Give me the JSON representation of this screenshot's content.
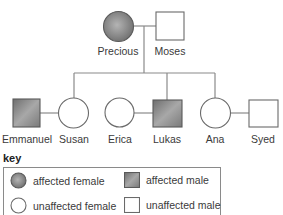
{
  "diagram": {
    "type": "pedigree",
    "colors": {
      "affected_fill_light": "#b4b4b4",
      "affected_fill_dark": "#6e6e6e",
      "outline": "#5a5a5a",
      "line": "#8a8a8a",
      "text": "#3a3a3a"
    },
    "generation_1": [
      {
        "name": "Precious",
        "sex": "female",
        "status": "affected"
      },
      {
        "name": "Moses",
        "sex": "male",
        "status": "unaffected"
      }
    ],
    "generation_2": [
      {
        "name": "Emmanuel",
        "sex": "male",
        "status": "affected",
        "relation": "partner of Susan"
      },
      {
        "name": "Susan",
        "sex": "female",
        "status": "unaffected",
        "relation": "child of Precious and Moses"
      },
      {
        "name": "Erica",
        "sex": "female",
        "status": "unaffected",
        "relation": "partner of Lukas"
      },
      {
        "name": "Lukas",
        "sex": "male",
        "status": "affected",
        "relation": "child of Precious and Moses"
      },
      {
        "name": "Ana",
        "sex": "female",
        "status": "unaffected",
        "relation": "child of Precious and Moses"
      },
      {
        "name": "Syed",
        "sex": "male",
        "status": "unaffected",
        "relation": "partner of Ana"
      }
    ]
  },
  "key": {
    "title": "key",
    "items": [
      {
        "label": "affected female",
        "symbol": "shaded-circle"
      },
      {
        "label": "affected male",
        "symbol": "shaded-square"
      },
      {
        "label": "unaffected female",
        "symbol": "open-circle"
      },
      {
        "label": "unaffected male",
        "symbol": "open-square"
      }
    ]
  }
}
